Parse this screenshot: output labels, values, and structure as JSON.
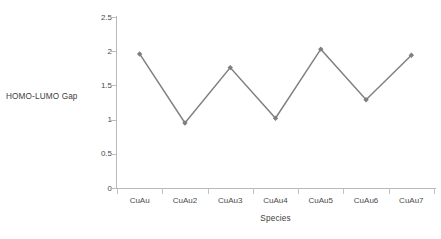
{
  "chart_data": {
    "type": "line",
    "title": "",
    "xlabel": "Species",
    "ylabel": "HOMO-LUMO Gap",
    "categories": [
      "CuAu",
      "CuAu2",
      "CuAu3",
      "CuAu4",
      "CuAu5",
      "CuAu6",
      "CuAu7"
    ],
    "values": [
      1.96,
      0.95,
      1.76,
      1.02,
      2.03,
      1.29,
      1.94
    ],
    "series": [
      {
        "name": "HOMO-LUMO Gap",
        "values": [
          1.96,
          0.95,
          1.76,
          1.02,
          2.03,
          1.29,
          1.94
        ]
      }
    ],
    "ylim": [
      0,
      2.5
    ],
    "ytick_labels": [
      "0",
      "0.5",
      "1",
      "1.5",
      "2",
      "2.5"
    ],
    "ytick_values": [
      0,
      0.5,
      1,
      1.5,
      2,
      2.5
    ],
    "grid": false,
    "legend": false,
    "legend_position": "none",
    "marker": "diamond",
    "colors": {
      "line": "#808080",
      "marker": "#7f7f7f",
      "axis": "#b9b9b9",
      "tick": "#c2c2c2",
      "text": "#3d3d3d",
      "background": "#ffffff"
    }
  },
  "axes": {
    "y_title": "HOMO-LUMO Gap",
    "x_title": "Species"
  }
}
